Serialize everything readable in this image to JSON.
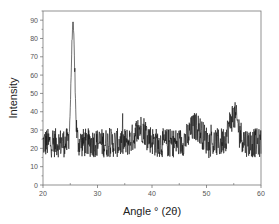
{
  "chart_data": {
    "type": "line",
    "title": "",
    "xlabel": "Angle ° (2θ)",
    "ylabel": "Intensity",
    "xlim": [
      20,
      60
    ],
    "ylim": [
      0,
      95
    ],
    "xticks": [
      20,
      30,
      40,
      50,
      60
    ],
    "yticks": [
      0,
      10,
      20,
      30,
      40,
      50,
      60,
      70,
      80,
      90
    ],
    "grid": false,
    "legend": null,
    "series": [
      {
        "name": "XRD pattern",
        "color": "#111111",
        "description": "Noisy diffraction pattern with baseline ~22-25, sharp peak at 25.5° reaching ~88, broad humps near 38°, 48° and 55°",
        "peaks": [
          {
            "x": 25.5,
            "y": 88,
            "width": 0.45
          },
          {
            "x": 38.0,
            "y": 31,
            "width": 1.5
          },
          {
            "x": 48.0,
            "y": 32,
            "width": 1.5
          },
          {
            "x": 55.0,
            "y": 38,
            "width": 1.2
          }
        ],
        "baseline": 23,
        "noise_amplitude": 8,
        "x_start": 20,
        "x_end": 60,
        "points": 800
      }
    ]
  }
}
